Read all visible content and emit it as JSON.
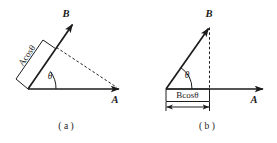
{
  "figure": {
    "background_color": "#ffffff",
    "ink_color": "#1c1c1c",
    "panels": [
      {
        "id": "a",
        "caption": "( a )",
        "vector_a_label": "A",
        "vector_b_label": "B",
        "angle_label": "θ",
        "projection_label_prefix": "A",
        "projection_label_cos": "cos",
        "projection_label_theta": "θ",
        "projection_label_full": "Acosθ",
        "description": "Vector A horizontal to the right, vector B at angle theta above it; the projection of A onto B, labelled Acosθ, is marked by a bracket perpendicular to B, with a dashed line from the foot of the perpendicular to the tip of A.",
        "angle_degrees": 38
      },
      {
        "id": "b",
        "caption": "( b )",
        "vector_a_label": "A",
        "vector_b_label": "B",
        "angle_label": "θ",
        "projection_label_prefix": "B",
        "projection_label_cos": "cos",
        "projection_label_theta": "θ",
        "projection_label_full": "Bcosθ",
        "description": "Vector A horizontal to the right, vector B at angle theta above it; the projection of B onto A, labelled Bcosθ, is marked by a dimension bar under the horizontal axis with a dashed vertical line from the tip of B.",
        "angle_degrees": 55
      }
    ]
  }
}
